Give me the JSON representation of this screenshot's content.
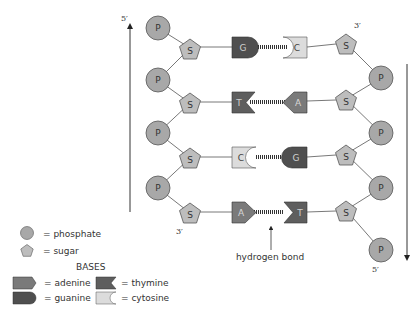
{
  "diagram": {
    "left_strand": {
      "top_label": "5′",
      "bottom_label": "3′",
      "direction": "up",
      "phosphate_label": "P",
      "sugar_label": "S"
    },
    "right_strand": {
      "top_label": "3′",
      "bottom_label": "5′",
      "direction": "down",
      "phosphate_label": "P",
      "sugar_label": "S"
    },
    "base_pairs": [
      {
        "left": "G",
        "right": "C"
      },
      {
        "left": "T",
        "right": "A"
      },
      {
        "left": "C",
        "right": "G"
      },
      {
        "left": "A",
        "right": "T"
      }
    ],
    "annotation": "hydrogen bond"
  },
  "legend": {
    "phosphate": "= phosphate",
    "sugar": "= sugar",
    "bases_heading": "BASES",
    "adenine": "= adenine",
    "thymine": "= thymine",
    "guanine": "= guanine",
    "cytosine": "= cytosine"
  },
  "colors": {
    "phosphate": "#a8a8a8",
    "sugar": "#bdbdbd",
    "adenine": "#7a7a7a",
    "thymine": "#5e5e5e",
    "guanine": "#4f4f4f",
    "cytosine": "#dcdcdc",
    "stroke": "#555555"
  }
}
